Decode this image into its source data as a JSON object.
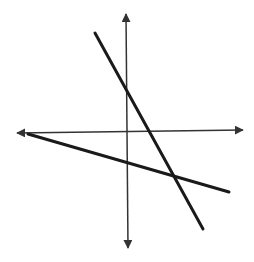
{
  "diagram": {
    "type": "coordinate-plane-two-lines",
    "background": "#ffffff",
    "axis_color": "#333333",
    "line_color": "#1a1a1a",
    "axes": {
      "x_axis": {
        "x1": 17,
        "y1": 133,
        "x2": 243,
        "y2": 130,
        "arrows": "both"
      },
      "y_axis": {
        "x1": 126,
        "y1": 14,
        "x2": 128,
        "y2": 248,
        "arrows": "both"
      }
    },
    "lines": [
      {
        "name": "steep-line",
        "x1": 95,
        "y1": 33,
        "x2": 203,
        "y2": 229
      },
      {
        "name": "shallow-line",
        "x1": 28,
        "y1": 134,
        "x2": 229,
        "y2": 192
      }
    ]
  }
}
